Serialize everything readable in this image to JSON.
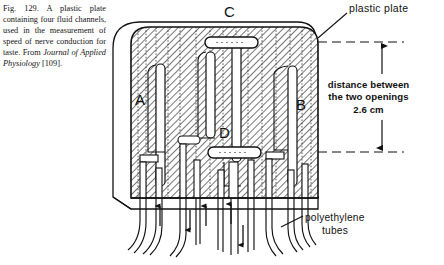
{
  "figure": {
    "caption": {
      "number": "Fig. 129.",
      "text_before_italic": " A plastic plate containing four fluid channels, used in the measurement of speed of nerve conduction for taste. From ",
      "italic_source": "Journal of Applied Physiology",
      "text_after_italic": " [109]."
    },
    "labels": {
      "plastic_plate": "plastic plate",
      "polyethylene_tubes_line1": "polyethylene",
      "polyethylene_tubes_line2": "tubes",
      "distance_line1": "distance between",
      "distance_line2": "the two openings",
      "distance_value": "2.6 cm"
    },
    "channel_letters": {
      "a": "A",
      "b": "B",
      "c": "C",
      "d": "D"
    },
    "colors": {
      "ink": "#111111",
      "hatch": "#4a4a4a",
      "plate_fill": "#ffffff",
      "channel_fill": "#ffffff",
      "background": "#ffffff"
    },
    "dimension": {
      "arrow_top_y": 42,
      "arrow_bottom_y": 152,
      "value": "2.6 cm"
    }
  }
}
